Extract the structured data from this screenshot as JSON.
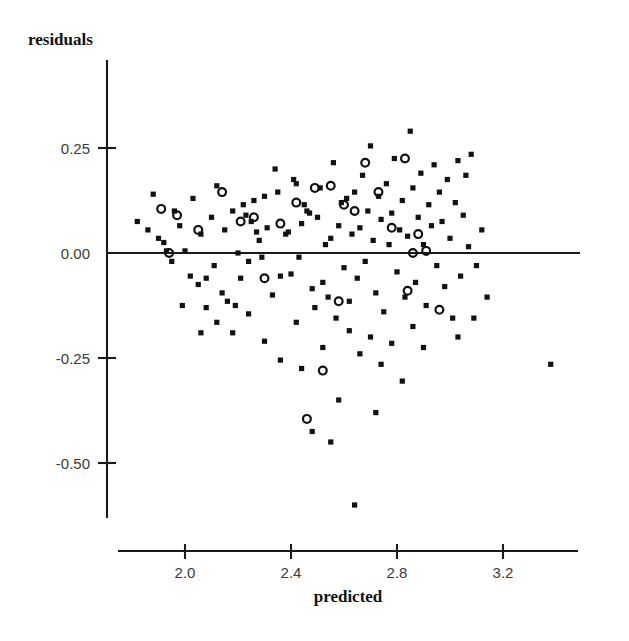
{
  "chart_data": {
    "type": "scatter",
    "title": "",
    "xlabel": "predicted",
    "ylabel": "residuals",
    "ylabel_position": "top-left",
    "grid": false,
    "legend": null,
    "xlim": [
      1.75,
      3.45
    ],
    "ylim": [
      -0.65,
      0.45
    ],
    "xticks": [
      2.0,
      2.4,
      2.8,
      3.2
    ],
    "xtick_labels": [
      "2.0",
      "2.4",
      "2.8",
      "3.2"
    ],
    "yticks": [
      0.25,
      0.0,
      -0.25,
      -0.5
    ],
    "ytick_labels": [
      "0.25",
      "0.00",
      "-0.25",
      "-0.50"
    ],
    "zero_reference_line": 0.0,
    "marker_colors": {
      "square": "#111111",
      "circle": "#111111"
    },
    "series": [
      {
        "name": "filled-squares",
        "marker": "square",
        "points": [
          [
            1.82,
            0.075
          ],
          [
            1.86,
            0.055
          ],
          [
            1.88,
            0.14
          ],
          [
            1.9,
            0.035
          ],
          [
            1.92,
            0.025
          ],
          [
            1.93,
            0.005
          ],
          [
            1.95,
            -0.02
          ],
          [
            1.96,
            0.1
          ],
          [
            1.98,
            0.065
          ],
          [
            2.0,
            0.005
          ],
          [
            2.02,
            -0.055
          ],
          [
            2.03,
            0.13
          ],
          [
            2.05,
            -0.075
          ],
          [
            2.06,
            0.045
          ],
          [
            2.08,
            -0.06
          ],
          [
            2.1,
            0.085
          ],
          [
            2.11,
            -0.03
          ],
          [
            2.12,
            0.16
          ],
          [
            2.14,
            -0.095
          ],
          [
            2.15,
            0.055
          ],
          [
            2.16,
            -0.115
          ],
          [
            2.18,
            0.1
          ],
          [
            2.19,
            -0.125
          ],
          [
            2.2,
            0.0
          ],
          [
            2.21,
            -0.06
          ],
          [
            2.22,
            0.115
          ],
          [
            2.23,
            0.09
          ],
          [
            2.24,
            -0.02
          ],
          [
            2.25,
            0.075
          ],
          [
            2.26,
            0.125
          ],
          [
            2.27,
            0.05
          ],
          [
            2.28,
            0.03
          ],
          [
            2.29,
            -0.01
          ],
          [
            2.3,
            0.135
          ],
          [
            2.31,
            0.06
          ],
          [
            2.33,
            -0.1
          ],
          [
            2.34,
            0.2
          ],
          [
            2.35,
            0.145
          ],
          [
            2.36,
            -0.055
          ],
          [
            2.38,
            0.045
          ],
          [
            2.39,
            0.05
          ],
          [
            2.4,
            -0.05
          ],
          [
            2.41,
            0.175
          ],
          [
            2.42,
            0.165
          ],
          [
            2.43,
            -0.01
          ],
          [
            2.44,
            0.07
          ],
          [
            2.45,
            0.115
          ],
          [
            2.46,
            0.1
          ],
          [
            2.47,
            0.095
          ],
          [
            2.48,
            -0.085
          ],
          [
            2.49,
            -0.13
          ],
          [
            2.5,
            0.085
          ],
          [
            2.51,
            0.155
          ],
          [
            2.52,
            -0.07
          ],
          [
            2.53,
            0.02
          ],
          [
            2.54,
            -0.105
          ],
          [
            2.55,
            0.035
          ],
          [
            2.56,
            0.215
          ],
          [
            2.57,
            -0.155
          ],
          [
            2.58,
            0.065
          ],
          [
            2.59,
            0.12
          ],
          [
            2.6,
            -0.035
          ],
          [
            2.61,
            0.13
          ],
          [
            2.62,
            -0.115
          ],
          [
            2.63,
            0.045
          ],
          [
            2.64,
            0.145
          ],
          [
            2.65,
            -0.06
          ],
          [
            2.66,
            0.06
          ],
          [
            2.67,
            0.185
          ],
          [
            2.68,
            -0.02
          ],
          [
            2.69,
            0.1
          ],
          [
            2.7,
            0.255
          ],
          [
            2.71,
            0.03
          ],
          [
            2.72,
            -0.095
          ],
          [
            2.73,
            0.135
          ],
          [
            2.74,
            0.08
          ],
          [
            2.75,
            -0.14
          ],
          [
            2.76,
            0.165
          ],
          [
            2.77,
            0.02
          ],
          [
            2.78,
            0.095
          ],
          [
            2.79,
            0.225
          ],
          [
            2.8,
            -0.045
          ],
          [
            2.81,
            0.055
          ],
          [
            2.82,
            0.125
          ],
          [
            2.83,
            -0.105
          ],
          [
            2.84,
            0.04
          ],
          [
            2.85,
            0.29
          ],
          [
            2.86,
            0.155
          ],
          [
            2.87,
            -0.07
          ],
          [
            2.88,
            0.085
          ],
          [
            2.89,
            0.19
          ],
          [
            2.9,
            0.02
          ],
          [
            2.91,
            -0.125
          ],
          [
            2.92,
            0.115
          ],
          [
            2.93,
            0.065
          ],
          [
            2.94,
            0.21
          ],
          [
            2.95,
            -0.03
          ],
          [
            2.96,
            0.145
          ],
          [
            2.97,
            0.075
          ],
          [
            2.98,
            -0.08
          ],
          [
            2.99,
            0.175
          ],
          [
            3.0,
            0.035
          ],
          [
            3.01,
            -0.155
          ],
          [
            3.02,
            0.12
          ],
          [
            3.03,
            0.22
          ],
          [
            3.04,
            -0.055
          ],
          [
            3.05,
            0.09
          ],
          [
            3.06,
            0.185
          ],
          [
            3.07,
            0.015
          ],
          [
            3.08,
            0.235
          ],
          [
            3.1,
            -0.03
          ],
          [
            3.12,
            0.055
          ],
          [
            2.36,
            -0.255
          ],
          [
            2.44,
            -0.275
          ],
          [
            2.52,
            -0.225
          ],
          [
            2.58,
            -0.35
          ],
          [
            2.62,
            -0.185
          ],
          [
            2.66,
            -0.24
          ],
          [
            2.7,
            -0.2
          ],
          [
            2.74,
            -0.265
          ],
          [
            2.78,
            -0.215
          ],
          [
            2.82,
            -0.305
          ],
          [
            2.86,
            -0.175
          ],
          [
            2.9,
            -0.225
          ],
          [
            2.48,
            -0.425
          ],
          [
            2.55,
            -0.45
          ],
          [
            2.64,
            -0.6
          ],
          [
            2.72,
            -0.38
          ],
          [
            2.18,
            -0.19
          ],
          [
            2.24,
            -0.145
          ],
          [
            2.3,
            -0.21
          ],
          [
            2.42,
            -0.165
          ],
          [
            3.38,
            -0.265
          ],
          [
            2.12,
            -0.165
          ],
          [
            2.08,
            -0.13
          ],
          [
            2.06,
            -0.19
          ],
          [
            1.99,
            -0.125
          ],
          [
            3.14,
            -0.105
          ],
          [
            3.09,
            -0.155
          ],
          [
            3.03,
            -0.2
          ]
        ]
      },
      {
        "name": "open-circles",
        "marker": "circle",
        "points": [
          [
            1.91,
            0.105
          ],
          [
            1.97,
            0.09
          ],
          [
            2.05,
            0.055
          ],
          [
            2.14,
            0.145
          ],
          [
            2.21,
            0.075
          ],
          [
            2.26,
            0.085
          ],
          [
            1.94,
            0.0
          ],
          [
            2.42,
            0.12
          ],
          [
            2.49,
            0.155
          ],
          [
            2.55,
            0.16
          ],
          [
            2.6,
            0.115
          ],
          [
            2.64,
            0.1
          ],
          [
            2.68,
            0.215
          ],
          [
            2.73,
            0.145
          ],
          [
            2.78,
            0.06
          ],
          [
            2.83,
            0.225
          ],
          [
            2.88,
            0.045
          ],
          [
            2.91,
            0.005
          ],
          [
            2.3,
            -0.06
          ],
          [
            2.58,
            -0.115
          ],
          [
            2.84,
            -0.09
          ],
          [
            2.96,
            -0.135
          ],
          [
            2.52,
            -0.28
          ],
          [
            2.46,
            -0.395
          ],
          [
            2.86,
            0.0
          ],
          [
            2.36,
            0.07
          ]
        ]
      }
    ]
  },
  "axes": {
    "y_axis_label": "residuals",
    "x_axis_label": "predicted"
  }
}
